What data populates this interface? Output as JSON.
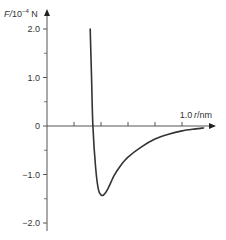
{
  "chart_data": {
    "type": "line",
    "title": "",
    "xlabel": "r/nm",
    "ylabel": "F/10^-4 N",
    "ylabel_parts": {
      "var": "F",
      "unit_base": "/10",
      "exp": "−4",
      "unit": " N"
    },
    "xlabel_parts": {
      "var": "r",
      "unit": "/nm"
    },
    "xlim": [
      0,
      1.2
    ],
    "ylim": [
      -2.2,
      2.3
    ],
    "x_ticks": [
      0.2,
      0.4,
      0.6,
      0.8,
      1.0
    ],
    "x_tick_labels": [
      {
        "value": 1.0,
        "label": "1.0"
      }
    ],
    "y_ticks_major": [
      2.0,
      1.0,
      0,
      -1.0,
      -2.0
    ],
    "y_tick_labels": [
      "2.0",
      "1.0",
      "0",
      "−1.0",
      "−2.0"
    ],
    "y_ticks_minor": [
      1.5,
      0.5,
      -0.5,
      -1.5
    ],
    "grid": false,
    "legend": null,
    "series": [
      {
        "name": "F(r)",
        "color": "#333333",
        "x": [
          0.32,
          0.33,
          0.34,
          0.36,
          0.38,
          0.4,
          0.42,
          0.45,
          0.5,
          0.55,
          0.6,
          0.7,
          0.8,
          0.9,
          1.0,
          1.1,
          1.16
        ],
        "values": [
          2.0,
          1.0,
          0.0,
          -0.85,
          -1.3,
          -1.42,
          -1.42,
          -1.3,
          -1.01,
          -0.8,
          -0.64,
          -0.43,
          -0.27,
          -0.17,
          -0.1,
          -0.06,
          -0.04
        ]
      }
    ]
  }
}
